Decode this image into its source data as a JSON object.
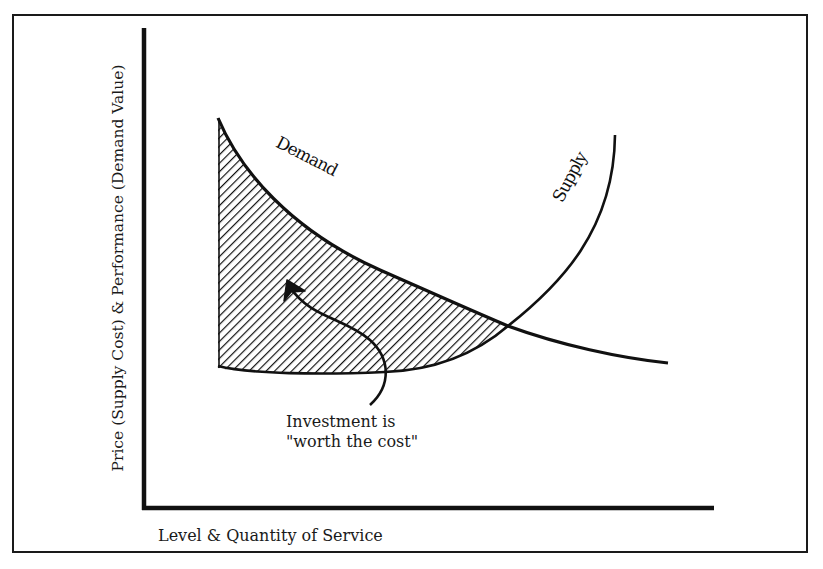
{
  "diagram": {
    "type": "supply-demand-curve",
    "y_axis_label": "Price (Supply Cost) & Performance (Demand Value)",
    "x_axis_label": "Level & Quantity of Service",
    "curves": [
      {
        "name": "Demand",
        "label": "Demand",
        "shape": "downward-sloping convex"
      },
      {
        "name": "Supply",
        "label": "Supply",
        "shape": "upward-sloping convex"
      }
    ],
    "shaded_region": {
      "pattern": "diagonal-hatch",
      "description": "area between demand (above) and supply (below) left of intersection"
    },
    "annotation": {
      "line1": "Investment is",
      "line2": "\"worth the cost\"",
      "pointer": "curved-arrow"
    },
    "colors": {
      "ink": "#111111",
      "background": "#ffffff"
    }
  }
}
